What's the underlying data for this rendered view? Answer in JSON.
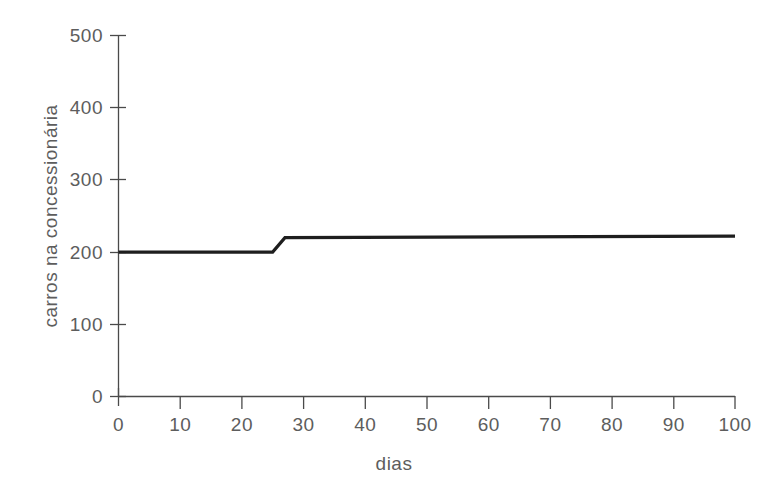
{
  "chart_data": {
    "type": "line",
    "title": "",
    "xlabel": "dias",
    "ylabel": "carros na concessionária",
    "xlim": [
      0,
      100
    ],
    "ylim": [
      0,
      500
    ],
    "grid": false,
    "legend": null,
    "xticks": [
      0,
      10,
      20,
      30,
      40,
      50,
      60,
      70,
      80,
      90,
      100
    ],
    "xtick_labels": [
      "0",
      "10",
      "20",
      "30",
      "40",
      "50",
      "60",
      "70",
      "80",
      "90",
      "100"
    ],
    "yticks": [
      0,
      100,
      200,
      300,
      400,
      500
    ],
    "ytick_labels": [
      "0",
      "100",
      "200",
      "300",
      "400",
      "500"
    ],
    "series": [
      {
        "name": "carros na concessionária",
        "color": "#1e1e1e",
        "x": [
          0,
          25,
          27,
          100
        ],
        "values": [
          200,
          200,
          220,
          222
        ]
      }
    ]
  },
  "axis": {
    "x_title": "dias",
    "y_title": "carros na concessionária"
  }
}
